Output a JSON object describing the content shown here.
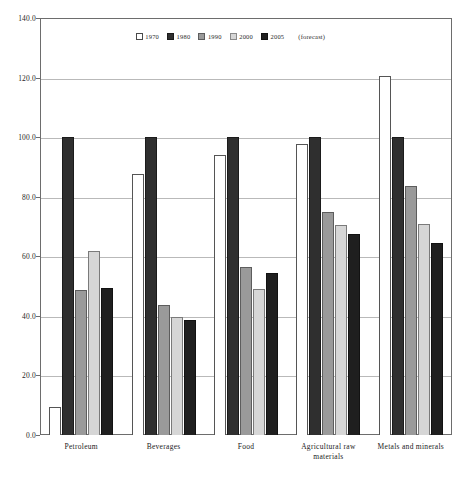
{
  "chart_data": {
    "type": "bar",
    "title": "",
    "subtitle": "",
    "xlabel": "",
    "ylabel": "",
    "ylim": [
      0,
      140
    ],
    "ytick_labels": [
      "140.0",
      "120.0",
      "100.0",
      "80.0",
      "60.0",
      "40.0",
      "20.0",
      "0.0"
    ],
    "ytick_values": [
      140,
      120,
      100,
      80,
      60,
      40,
      20,
      0
    ],
    "grid": true,
    "legend_position": "top-center",
    "legend_note": "(forecast)",
    "categories": [
      "Petroleum",
      "Beverages",
      "Food",
      "Agricultural raw materials",
      "Metals and minerals"
    ],
    "series": [
      {
        "name": "1970",
        "color": "#ffffff",
        "values": [
          9.3,
          87.7,
          94.0,
          97.8,
          120.5
        ]
      },
      {
        "name": "1980",
        "color": "#2f2f2f",
        "values": [
          100.0,
          100.0,
          100.0,
          100.0,
          100.0
        ]
      },
      {
        "name": "1990",
        "color": "#9a9a9a",
        "values": [
          48.7,
          43.5,
          56.5,
          75.0,
          83.5
        ]
      },
      {
        "name": "2000",
        "color": "#d6d6d6",
        "values": [
          61.7,
          39.5,
          49.0,
          70.5,
          71.0
        ]
      },
      {
        "name": "2005",
        "color": "#1f1f1f",
        "values": [
          49.3,
          38.5,
          54.5,
          67.5,
          64.5
        ]
      }
    ]
  }
}
